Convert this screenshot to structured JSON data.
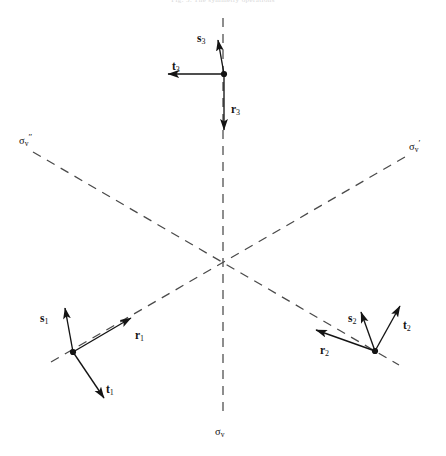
{
  "figure": {
    "caption_cut_off": "Fig. 3. The symmetry operations",
    "background_color": "#ffffff",
    "line_color": "#3c3c3c",
    "vector_color": "#141414",
    "width": 446,
    "height": 456,
    "center": {
      "x": 223,
      "y": 263
    }
  },
  "mirror_planes": [
    {
      "id": "sigma-v",
      "label_base": "σ",
      "label_sub": "v",
      "label_prime": "",
      "label_text": "σv",
      "orientation": "vertical",
      "x1": 223,
      "y1": 18,
      "x2": 223,
      "y2": 414,
      "label_x": 215,
      "label_y": 424
    },
    {
      "id": "sigma-v-prime",
      "label_base": "σ",
      "label_sub": "v",
      "label_prime": "′",
      "label_text": "σv′",
      "orientation": "diagonal-up-right",
      "x1": 51,
      "y1": 362,
      "x2": 405,
      "y2": 157,
      "label_x": 409,
      "label_y": 139
    },
    {
      "id": "sigma-v-double-prime",
      "label_base": "σ",
      "label_sub": "v",
      "label_prime": "″",
      "label_text": "σv″",
      "orientation": "diagonal-down-right",
      "x1": 33,
      "y1": 152,
      "x2": 399,
      "y2": 365,
      "label_x": 19,
      "label_y": 133
    }
  ],
  "sites": [
    {
      "id": "site-1",
      "index": "1",
      "vertex": {
        "x": 73,
        "y": 352
      },
      "vectors": [
        {
          "name": "r",
          "subscript": "1",
          "label": "r",
          "tip": {
            "x": 131,
            "y": 318
          },
          "label_x": 135,
          "label_y": 330
        },
        {
          "name": "s",
          "subscript": "1",
          "label": "s",
          "tip": {
            "x": 65,
            "y": 308
          },
          "label_x": 40,
          "label_y": 313
        },
        {
          "name": "t",
          "subscript": "1",
          "label": "t",
          "tip": {
            "x": 104,
            "y": 398
          },
          "label_x": 106,
          "label_y": 384
        }
      ]
    },
    {
      "id": "site-2",
      "index": "2",
      "vertex": {
        "x": 375,
        "y": 351
      },
      "vectors": [
        {
          "name": "r",
          "subscript": "2",
          "label": "r",
          "tip": {
            "x": 316,
            "y": 330
          },
          "label_x": 320,
          "label_y": 345
        },
        {
          "name": "s",
          "subscript": "2",
          "label": "s",
          "tip": {
            "x": 361,
            "y": 312
          },
          "label_x": 348,
          "label_y": 313
        },
        {
          "name": "t",
          "subscript": "2",
          "label": "t",
          "tip": {
            "x": 400,
            "y": 306
          },
          "label_x": 403,
          "label_y": 320
        }
      ]
    },
    {
      "id": "site-3",
      "index": "3",
      "vertex": {
        "x": 224,
        "y": 74
      },
      "vectors": [
        {
          "name": "r",
          "subscript": "3",
          "label": "r",
          "tip": {
            "x": 224,
            "y": 130
          },
          "label_x": 231,
          "label_y": 104
        },
        {
          "name": "s",
          "subscript": "3",
          "label": "s",
          "tip": {
            "x": 218,
            "y": 40
          },
          "label_x": 197,
          "label_y": 33
        },
        {
          "name": "t",
          "subscript": "3",
          "label": "t",
          "tip": {
            "x": 168,
            "y": 74
          },
          "label_x": 172,
          "label_y": 61
        }
      ]
    }
  ]
}
